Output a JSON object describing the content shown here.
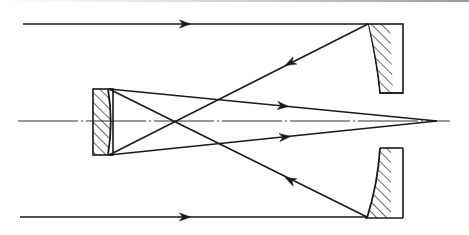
{
  "diagram": {
    "type": "reflecting-telescope-optics",
    "colors": {
      "stroke": "#1a1a1a",
      "background": "#ffffff",
      "axis": "#333333"
    },
    "optical_axis": {
      "x1": 18,
      "y1": 121,
      "x2": 450,
      "y2": 121
    },
    "focus": {
      "x": 437,
      "y": 121
    },
    "primary_mirror": {
      "top": {
        "x": 370,
        "y": 24,
        "w": 33,
        "h": 69,
        "curve_top_x": 368,
        "curve_bottom_x": 380
      },
      "bottom": {
        "x": 380,
        "y": 148,
        "w": 23,
        "h": 70,
        "curve_top_x": 380,
        "curve_bottom_x": 367
      }
    },
    "secondary_mirror": {
      "x": 93,
      "y": 89,
      "w": 20,
      "h": 66,
      "curve_x_edge": 108,
      "curve_x_mid": 111
    },
    "rays": [
      {
        "name": "incoming-top",
        "from": [
          23,
          24
        ],
        "to": [
          368,
          24
        ],
        "arrow_at": [
          185,
          24
        ],
        "dir": "right"
      },
      {
        "name": "incoming-bottom",
        "from": [
          20,
          217
        ],
        "to": [
          367,
          217
        ],
        "arrow_at": [
          185,
          217
        ],
        "dir": "right"
      },
      {
        "name": "reflect-top-primary",
        "from": [
          368,
          24
        ],
        "to": [
          109,
          155
        ],
        "arrow_at": [
          290,
          63
        ],
        "dir": "left"
      },
      {
        "name": "reflect-bottom-primary",
        "from": [
          367,
          217
        ],
        "to": [
          109,
          89
        ],
        "arrow_at": [
          290,
          180
        ],
        "dir": "left"
      },
      {
        "name": "secondary-bottom-to-focus",
        "from": [
          109,
          155
        ],
        "to": [
          437,
          121
        ],
        "arrow_at": [
          285,
          137
        ],
        "dir": "right"
      },
      {
        "name": "secondary-top-to-focus",
        "from": [
          109,
          89
        ],
        "to": [
          437,
          121
        ],
        "arrow_at": [
          283,
          106
        ],
        "dir": "right"
      }
    ]
  }
}
